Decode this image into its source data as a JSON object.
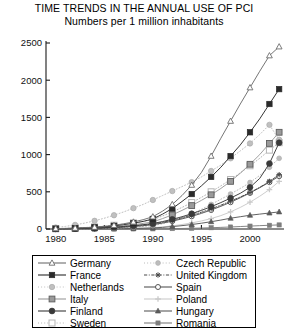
{
  "chart_data": {
    "type": "line",
    "title": "TIME TRENDS IN THE ANNUAL USE OF PCI",
    "subtitle": "Numbers per 1 million inhabitants",
    "xlabel": "",
    "ylabel": "",
    "xlim": [
      1979,
      2003.5
    ],
    "ylim": [
      0,
      2500
    ],
    "xticks": [
      1980,
      1985,
      1990,
      1995,
      2000
    ],
    "yticks": [
      0,
      500,
      1000,
      1500,
      2000,
      2500
    ],
    "grid": false,
    "legend_position": "below",
    "x": [
      1980,
      1981,
      1982,
      1983,
      1984,
      1985,
      1986,
      1987,
      1988,
      1989,
      1990,
      1991,
      1992,
      1993,
      1994,
      1995,
      1996,
      1997,
      1998,
      1999,
      2000,
      2001,
      2002,
      2003
    ],
    "series": [
      {
        "name": "Germany",
        "marker": "open-triangle",
        "line": "solid",
        "color": "#6e6e6e",
        "values": [
          5,
          8,
          12,
          18,
          25,
          35,
          50,
          70,
          95,
          125,
          165,
          240,
          330,
          450,
          590,
          760,
          980,
          1220,
          1450,
          1680,
          1900,
          2120,
          2330,
          2450
        ]
      },
      {
        "name": "France",
        "marker": "filled-square",
        "line": "solid",
        "color": "#2a2a2a",
        "values": [
          4,
          6,
          10,
          15,
          22,
          30,
          42,
          58,
          78,
          102,
          135,
          200,
          275,
          370,
          470,
          580,
          700,
          830,
          980,
          1130,
          1300,
          1480,
          1680,
          1880
        ]
      },
      {
        "name": "Netherlands",
        "marker": "light-circle",
        "line": "dotted",
        "color": "#c0c0c0",
        "values": [
          20,
          35,
          55,
          80,
          110,
          145,
          185,
          230,
          280,
          330,
          390,
          450,
          510,
          570,
          630,
          700,
          780,
          860,
          950,
          1050,
          1150,
          1270,
          1400,
          1200
        ]
      },
      {
        "name": "Italy",
        "marker": "gray-square",
        "line": "solid",
        "color": "#9a9a9a",
        "values": [
          3,
          5,
          8,
          12,
          17,
          24,
          33,
          44,
          58,
          75,
          95,
          140,
          190,
          250,
          315,
          385,
          460,
          545,
          640,
          750,
          870,
          1000,
          1150,
          1300
        ]
      },
      {
        "name": "Finland",
        "marker": "filled-circle",
        "line": "solid",
        "color": "#3a3a3a",
        "values": [
          2,
          3,
          5,
          8,
          12,
          18,
          25,
          34,
          45,
          58,
          74,
          100,
          130,
          165,
          205,
          250,
          300,
          355,
          415,
          480,
          560,
          680,
          880,
          1160
        ]
      },
      {
        "name": "Sweden",
        "marker": "open-square-light",
        "line": "dotted",
        "color": "#b5b5b5",
        "values": [
          6,
          9,
          14,
          20,
          28,
          38,
          50,
          65,
          82,
          102,
          125,
          175,
          230,
          290,
          355,
          425,
          500,
          580,
          665,
          755,
          850,
          950,
          1060,
          1160
        ]
      },
      {
        "name": "Czech Republic",
        "marker": "dotted-circle",
        "line": "dotted",
        "color": "#bcbcbc",
        "values": [
          1,
          2,
          3,
          4,
          6,
          9,
          13,
          18,
          25,
          34,
          45,
          70,
          105,
          150,
          205,
          265,
          330,
          400,
          470,
          545,
          625,
          720,
          830,
          950
        ]
      },
      {
        "name": "United Kingdom",
        "marker": "asterisk",
        "line": "dash-dot",
        "color": "#4a4a4a",
        "values": [
          2,
          3,
          5,
          7,
          11,
          16,
          22,
          30,
          40,
          52,
          66,
          90,
          118,
          150,
          185,
          225,
          270,
          320,
          375,
          430,
          490,
          560,
          640,
          730
        ]
      },
      {
        "name": "Spain",
        "marker": "open-circle",
        "line": "solid",
        "color": "#555555",
        "values": [
          1,
          2,
          3,
          5,
          8,
          12,
          17,
          24,
          33,
          44,
          58,
          80,
          106,
          136,
          170,
          210,
          255,
          305,
          360,
          420,
          485,
          555,
          630,
          710
        ]
      },
      {
        "name": "Poland",
        "marker": "light-plus",
        "line": "solid",
        "color": "#cacaca",
        "values": [
          0,
          0,
          1,
          1,
          2,
          3,
          4,
          6,
          9,
          13,
          18,
          28,
          42,
          60,
          82,
          108,
          140,
          180,
          230,
          290,
          360,
          440,
          530,
          640
        ]
      },
      {
        "name": "Hungary",
        "marker": "filled-triangle",
        "line": "solid",
        "color": "#5a5a5a",
        "values": [
          0,
          0,
          0,
          1,
          1,
          2,
          3,
          5,
          7,
          10,
          14,
          22,
          32,
          45,
          60,
          78,
          98,
          120,
          145,
          165,
          185,
          200,
          215,
          230
        ]
      },
      {
        "name": "Romania",
        "marker": "small-filled-square",
        "line": "solid",
        "color": "#7d7d7d",
        "values": [
          0,
          0,
          0,
          0,
          0,
          0,
          0,
          0,
          1,
          1,
          2,
          3,
          5,
          7,
          10,
          13,
          17,
          22,
          27,
          33,
          39,
          45,
          50,
          55
        ]
      }
    ]
  },
  "legend": {
    "left_column": [
      {
        "label": "Germany"
      },
      {
        "label": "France"
      },
      {
        "label": "Netherlands"
      },
      {
        "label": "Italy"
      },
      {
        "label": "Finland"
      },
      {
        "label": "Sweden"
      }
    ],
    "right_column": [
      {
        "label": "Czech Republic"
      },
      {
        "label": "United Kingdom"
      },
      {
        "label": "Spain"
      },
      {
        "label": "Poland"
      },
      {
        "label": "Hungary"
      },
      {
        "label": "Romania"
      }
    ]
  }
}
